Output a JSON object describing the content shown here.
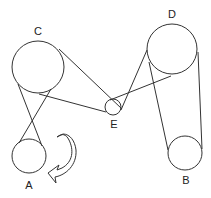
{
  "diagram": {
    "type": "belt-and-pulley system",
    "pulleys": [
      {
        "id": "A",
        "label": "A",
        "cx": 29,
        "cy": 156,
        "r": 17,
        "label_x": 29,
        "label_y": 189
      },
      {
        "id": "B",
        "label": "B",
        "cx": 185,
        "cy": 153,
        "r": 17,
        "label_x": 186,
        "label_y": 184
      },
      {
        "id": "C",
        "label": "C",
        "cx": 38,
        "cy": 67,
        "r": 26,
        "label_x": 38,
        "label_y": 35
      },
      {
        "id": "D",
        "label": "D",
        "cx": 172,
        "cy": 49,
        "r": 25,
        "label_x": 172,
        "label_y": 18
      },
      {
        "id": "E",
        "label": "E",
        "cx": 113,
        "cy": 107,
        "r": 8,
        "label_x": 114,
        "label_y": 128
      }
    ],
    "belts": [
      {
        "name": "C-A crossed 1",
        "x1": 18,
        "y1": 84,
        "x2": 42,
        "y2": 146
      },
      {
        "name": "C-A crossed 2",
        "x1": 51,
        "y1": 89,
        "x2": 19,
        "y2": 143
      },
      {
        "name": "C-E top",
        "x1": 59,
        "y1": 49,
        "x2": 122,
        "y2": 109
      },
      {
        "name": "C-E bottom",
        "x1": 39,
        "y1": 94,
        "x2": 106,
        "y2": 112
      },
      {
        "name": "E-D 1",
        "x1": 110,
        "y1": 100,
        "x2": 171,
        "y2": 76
      },
      {
        "name": "E-D 2",
        "x1": 121,
        "y1": 110,
        "x2": 147,
        "y2": 50
      },
      {
        "name": "D-B left",
        "x1": 149,
        "y1": 62,
        "x2": 168,
        "y2": 150
      },
      {
        "name": "D-B right",
        "x1": 198,
        "y1": 52,
        "x2": 202,
        "y2": 149
      }
    ],
    "rotation_arrow": {
      "near": "A",
      "direction": "clockwise"
    }
  }
}
